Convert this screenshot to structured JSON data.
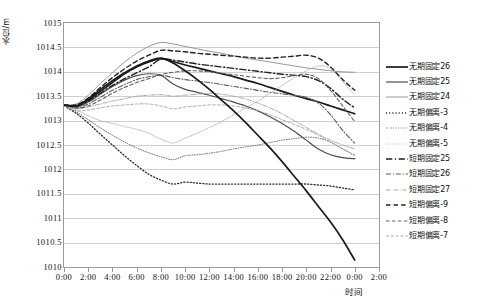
{
  "axes": {
    "y_title": "水位/m",
    "x_title": "时间",
    "y_ticks": [
      "1015",
      "1014.5",
      "1014",
      "1013.5",
      "1013",
      "1012.5",
      "1012",
      "1011.5",
      "1011",
      "1010.5",
      "1010"
    ],
    "x_ticks": [
      "0:00",
      "2:00",
      "4:00",
      "6:00",
      "8:00",
      "10:00",
      "12:00",
      "14:00",
      "16:00",
      "18:00",
      "20:00",
      "22:00",
      "0:00",
      "2:00"
    ]
  },
  "legend": {
    "items": [
      {
        "label": "无期固定26",
        "style": "solid",
        "width": 1.7,
        "color": "#1a1a1a"
      },
      {
        "label": "无期固定25",
        "style": "solid",
        "width": 1.2,
        "color": "#4d4d4d"
      },
      {
        "label": "无期固定24",
        "style": "solid",
        "width": 0.9,
        "color": "#8c8c8c"
      },
      {
        "label": "无期偏离-3",
        "style": "dotted",
        "width": 1.3,
        "color": "#2b2b2b"
      },
      {
        "label": "无期偏离-4",
        "style": "dotted",
        "width": 1.0,
        "color": "#6b6b6b"
      },
      {
        "label": "无期偏离-5",
        "style": "dotted",
        "width": 0.9,
        "color": "#a8a8a8"
      },
      {
        "label": "短期固定25",
        "style": "dashdot",
        "width": 1.4,
        "color": "#1f1f1f"
      },
      {
        "label": "短期固定26",
        "style": "dashdot",
        "width": 1.1,
        "color": "#5c5c5c"
      },
      {
        "label": "短期固定27",
        "style": "dashdot",
        "width": 0.9,
        "color": "#9c9c9c"
      },
      {
        "label": "短期偏离-9",
        "style": "dashed",
        "width": 1.4,
        "color": "#232323"
      },
      {
        "label": "短期偏离-8",
        "style": "dashed",
        "width": 1.1,
        "color": "#616161"
      },
      {
        "label": "短期偏离-7",
        "style": "dashed",
        "width": 0.9,
        "color": "#a0a0a0"
      }
    ]
  },
  "chart_data": {
    "type": "line",
    "title": "",
    "xlabel": "时间",
    "ylabel": "水位/m",
    "xlim": [
      0,
      26
    ],
    "ylim": [
      1010,
      1015
    ],
    "ytick_step": 0.5,
    "grid": true,
    "legend_position": "right",
    "x": [
      0,
      1,
      2,
      3,
      4,
      5,
      6,
      7,
      8,
      9,
      10,
      11,
      12,
      13,
      14,
      15,
      16,
      17,
      18,
      19,
      20,
      21,
      22,
      23,
      24,
      25,
      26
    ],
    "x_labels": [
      "0:00",
      "1:00",
      "2:00",
      "3:00",
      "4:00",
      "5:00",
      "6:00",
      "7:00",
      "8:00",
      "9:00",
      "10:00",
      "11:00",
      "12:00",
      "13:00",
      "14:00",
      "15:00",
      "16:00",
      "17:00",
      "18:00",
      "19:00",
      "20:00",
      "21:00",
      "22:00",
      "23:00",
      "0:00",
      "1:00",
      "2:00"
    ],
    "series": [
      {
        "name": "无期固定26",
        "values": [
          1013.32,
          1013.3,
          1013.42,
          1013.6,
          1013.78,
          1013.96,
          1014.1,
          1014.2,
          1014.27,
          1014.21,
          1014.14,
          1014.08,
          1014.02,
          1013.96,
          1013.9,
          1013.83,
          1013.76,
          1013.68,
          1013.6,
          1013.52,
          1013.45,
          1013.38,
          1013.3,
          1013.22,
          1013.14,
          null,
          null
        ]
      },
      {
        "name": "无期固定25",
        "values": [
          1013.32,
          1013.28,
          1013.38,
          1013.54,
          1013.7,
          1013.83,
          1013.92,
          1013.96,
          1013.93,
          1013.75,
          1013.64,
          1013.58,
          1013.52,
          1013.45,
          1013.38,
          1013.3,
          1013.2,
          1013.08,
          1012.94,
          1012.78,
          1012.6,
          1012.42,
          1012.3,
          1012.24,
          1012.22,
          null,
          null
        ]
      },
      {
        "name": "无期固定24",
        "values": [
          1013.32,
          1013.34,
          1013.52,
          1013.76,
          1013.98,
          1014.2,
          1014.38,
          1014.52,
          1014.6,
          1014.57,
          1014.52,
          1014.47,
          1014.42,
          1014.38,
          1014.33,
          1014.28,
          1014.24,
          1014.2,
          1014.16,
          1014.12,
          1014.08,
          1014.05,
          1014.02,
          1014.0,
          1013.99,
          null,
          null
        ]
      },
      {
        "name": "无期偏离-3",
        "values": [
          1013.3,
          1013.15,
          1012.95,
          1012.72,
          1012.5,
          1012.28,
          1012.08,
          1011.9,
          1011.78,
          1011.7,
          1011.74,
          1011.72,
          1011.7,
          1011.7,
          1011.7,
          1011.7,
          1011.7,
          1011.7,
          1011.7,
          1011.7,
          1011.7,
          1011.68,
          1011.66,
          1011.62,
          1011.58,
          null,
          null
        ]
      },
      {
        "name": "无期偏离-4",
        "values": [
          1013.3,
          1013.18,
          1013.02,
          1012.85,
          1012.7,
          1012.56,
          1012.44,
          1012.34,
          1012.26,
          1012.2,
          1012.28,
          1012.3,
          1012.33,
          1012.37,
          1012.42,
          1012.46,
          1012.5,
          1012.55,
          1012.6,
          1012.63,
          1012.66,
          1012.64,
          1012.56,
          1012.42,
          1012.28,
          null,
          null
        ]
      },
      {
        "name": "无期偏离-5",
        "values": [
          1013.3,
          1013.22,
          1013.1,
          1013.0,
          1012.94,
          1012.88,
          1012.82,
          1012.74,
          1012.62,
          1012.54,
          1012.64,
          1012.74,
          1012.86,
          1012.98,
          1013.12,
          1013.26,
          1013.4,
          1013.56,
          1013.72,
          1013.88,
          1014.02,
          1014.12,
          1014.06,
          1013.8,
          1013.52,
          null,
          null
        ]
      },
      {
        "name": "短期固定25",
        "values": [
          1013.32,
          1013.3,
          1013.4,
          1013.56,
          1013.72,
          1013.86,
          1013.98,
          1014.1,
          1014.26,
          1014.24,
          1014.2,
          1014.16,
          1014.13,
          1014.1,
          1014.07,
          1014.04,
          1014.01,
          1013.98,
          1013.95,
          1013.93,
          1013.9,
          1013.82,
          1013.66,
          1013.44,
          1013.26,
          null,
          null
        ]
      },
      {
        "name": "短期固定26",
        "values": [
          1013.32,
          1013.26,
          1013.34,
          1013.48,
          1013.62,
          1013.74,
          1013.84,
          1013.9,
          1013.93,
          1013.88,
          1013.84,
          1013.81,
          1013.78,
          1013.74,
          1013.7,
          1013.66,
          1013.62,
          1013.58,
          1013.55,
          1013.52,
          1013.48,
          1013.36,
          1013.12,
          1012.8,
          1012.54,
          null,
          null
        ]
      },
      {
        "name": "短期固定27",
        "values": [
          1013.32,
          1013.24,
          1013.28,
          1013.34,
          1013.4,
          1013.45,
          1013.5,
          1013.52,
          1013.53,
          1013.5,
          1013.52,
          1013.54,
          1013.56,
          1013.54,
          1013.5,
          1013.44,
          1013.36,
          1013.26,
          1013.14,
          1013.0,
          1012.86,
          1012.72,
          1012.6,
          1012.5,
          1012.42,
          null,
          null
        ]
      },
      {
        "name": "短期偏离-9",
        "values": [
          1013.32,
          1013.32,
          1013.46,
          1013.68,
          1013.88,
          1014.06,
          1014.22,
          1014.34,
          1014.44,
          1014.43,
          1014.41,
          1014.38,
          1014.36,
          1014.34,
          1014.32,
          1014.3,
          1014.28,
          1014.28,
          1014.3,
          1014.32,
          1014.34,
          1014.28,
          1014.1,
          1013.84,
          1013.62,
          null,
          null
        ]
      },
      {
        "name": "短期偏离-8",
        "values": [
          1013.32,
          1013.26,
          1013.3,
          1013.42,
          1013.56,
          1013.68,
          1013.78,
          1013.86,
          1013.94,
          1013.99,
          1014.02,
          1014.02,
          1014.0,
          1013.97,
          1013.94,
          1013.91,
          1013.88,
          1013.86,
          1013.88,
          1013.92,
          1013.95,
          1013.86,
          1013.62,
          1013.3,
          1012.98,
          null,
          null
        ]
      },
      {
        "name": "短期偏离-7",
        "values": [
          1013.3,
          1013.2,
          1013.22,
          1013.26,
          1013.3,
          1013.32,
          1013.34,
          1013.34,
          1013.3,
          1013.24,
          1013.28,
          1013.3,
          1013.32,
          1013.32,
          1013.3,
          1013.26,
          1013.2,
          1013.12,
          1013.02,
          1012.92,
          1012.82,
          1012.7,
          1012.56,
          1012.42,
          1012.3,
          null,
          null
        ]
      }
    ],
    "extra_series": [
      {
        "name": "无期固定26-descending",
        "style": "solid",
        "width": 1.7,
        "color": "#1a1a1a",
        "values": [
          1013.32,
          1013.3,
          1013.44,
          1013.64,
          1013.82,
          1013.98,
          1014.12,
          1014.22,
          1014.28,
          1014.18,
          1014.02,
          1013.84,
          1013.64,
          1013.42,
          1013.2,
          1012.96,
          1012.7,
          1012.44,
          1012.16,
          1011.86,
          1011.56,
          1011.24,
          1010.92,
          1010.56,
          1010.14,
          null,
          null
        ]
      }
    ]
  }
}
